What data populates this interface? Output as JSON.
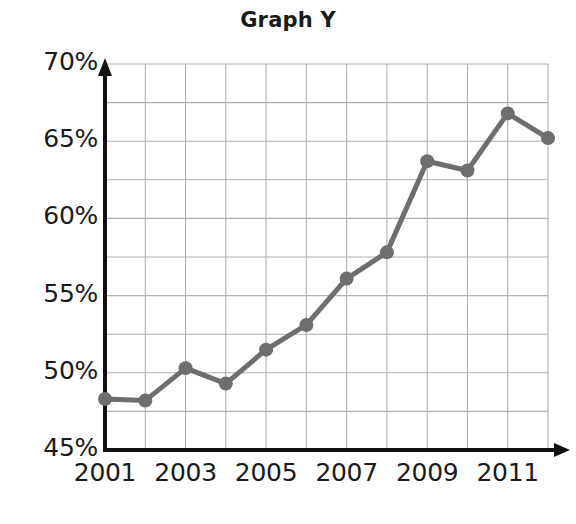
{
  "chart_data": {
    "type": "line",
    "title": "Graph Y",
    "xlabel": "",
    "ylabel": "",
    "x": [
      2001,
      2002,
      2003,
      2004,
      2005,
      2006,
      2007,
      2008,
      2009,
      2010,
      2011,
      2012
    ],
    "values": [
      48.3,
      48.2,
      50.3,
      49.3,
      51.5,
      53.1,
      56.1,
      57.8,
      63.7,
      63.1,
      66.8,
      65.2
    ],
    "xlim": [
      2001,
      2012
    ],
    "ylim": [
      45,
      70
    ],
    "y_major_ticks": [
      45,
      50,
      55,
      60,
      65,
      70
    ],
    "y_tick_labels": [
      "45%",
      "50%",
      "55%",
      "60%",
      "65%",
      "70%"
    ],
    "y_minor_step": 2.5,
    "x_tick_labels": [
      "2001",
      "2003",
      "2005",
      "2007",
      "2009",
      "2011"
    ],
    "x_tick_values": [
      2001,
      2003,
      2005,
      2007,
      2009,
      2011
    ],
    "grid": true,
    "legend": "none",
    "series_color": "#6e6e6e",
    "grid_color": "#b0b0b0",
    "axis_color": "#111111",
    "marker": "circle"
  }
}
